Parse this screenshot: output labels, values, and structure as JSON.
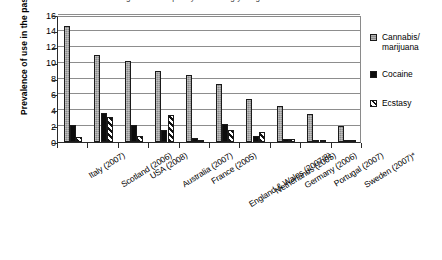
{
  "figure": {
    "cropped_title_fragment": "Prevalence of drug use in the past year among young adults"
  },
  "axes": {
    "ylabel": "Prevalence of use in the past year (%)",
    "xlabel": "",
    "yticks": [
      "0",
      "2",
      "4",
      "6",
      "8",
      "10",
      "12",
      "14",
      "16"
    ]
  },
  "legend": {
    "items": [
      {
        "label": "Cannabis/ marijuana",
        "key": "cannabis",
        "color": "#8c8c8c"
      },
      {
        "label": "Cocaine",
        "key": "cocaine",
        "color": "#0d0d0d"
      },
      {
        "label": "Ecstasy",
        "key": "ecstasy",
        "color": "#ffffff"
      }
    ]
  },
  "chart_data": {
    "type": "bar",
    "title": "Prevalence of drug use in the past year among young adults",
    "xlabel": "",
    "ylabel": "Prevalence of use in the past year (%)",
    "ylim": [
      0,
      16
    ],
    "ytick_step": 2,
    "grid": true,
    "legend_position": "right",
    "categories": [
      "Italy (2007)",
      "Scotland (2006)",
      "USA (2008)",
      "Australia (2007)",
      "France (2005)",
      "England & Wales (2007/8)",
      "Netherlands (2005)",
      "Germany (2006)",
      "Portugal (2007)",
      "Sweden (2007)*"
    ],
    "series": [
      {
        "name": "Cannabis/ marijuana",
        "color": "#8c8c8c",
        "values": [
          14.6,
          10.9,
          10.2,
          9.0,
          8.5,
          7.3,
          5.4,
          4.6,
          3.5,
          2.0
        ]
      },
      {
        "name": "Cocaine",
        "color": "#0d0d0d",
        "values": [
          2.2,
          3.7,
          2.1,
          1.5,
          0.5,
          2.3,
          0.7,
          0.4,
          0.3,
          0.1
        ]
      },
      {
        "name": "Ecstasy",
        "color": "#ffffff",
        "values": [
          0.6,
          3.1,
          0.7,
          3.4,
          0.2,
          1.5,
          1.2,
          0.4,
          0.2,
          0.1
        ]
      }
    ]
  }
}
